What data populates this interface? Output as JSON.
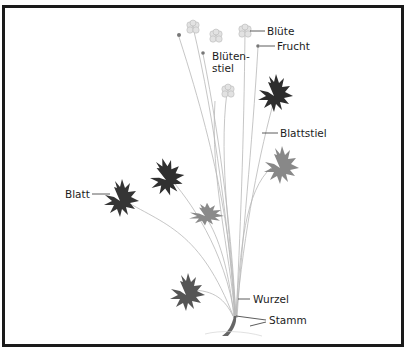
{
  "diagram": {
    "labels": {
      "bluete": "Blüte",
      "frucht": "Frucht",
      "bluetenstiel_line1": "Blüten-",
      "bluetenstiel_line2": "stiel",
      "blattstiel": "Blattstiel",
      "blatt": "Blatt",
      "wurzel": "Wurzel",
      "stamm": "Stamm"
    },
    "colors": {
      "frame": "#1a1a1a",
      "leaf_dark": "#2e2e2e",
      "leaf_light": "#7a7a7a",
      "stem": "#b5b5b5",
      "flower": "#d6d6d6",
      "text": "#1c1c1c"
    }
  }
}
